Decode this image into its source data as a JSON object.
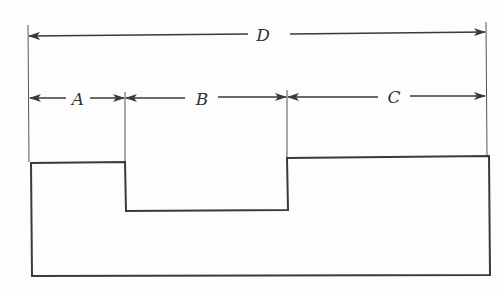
{
  "diagram": {
    "type": "dimensioned-profile",
    "colors": {
      "line": "#3a3a3a",
      "background": "#fdfdfd"
    },
    "dimensions": [
      {
        "id": "D",
        "label": "D",
        "from_x": 28,
        "to_x": 486,
        "y": 34,
        "label_x": 263
      },
      {
        "id": "A",
        "label": "A",
        "from_x": 29,
        "to_x": 125,
        "y": 98,
        "label_x": 77
      },
      {
        "id": "B",
        "label": "B",
        "from_x": 125,
        "to_x": 287,
        "y": 98,
        "label_x": 203
      },
      {
        "id": "C",
        "label": "C",
        "from_x": 287,
        "to_x": 486,
        "y": 97,
        "label_x": 392
      }
    ],
    "extension_lines": [
      {
        "x": 28,
        "y1": 25,
        "y2": 162
      },
      {
        "x": 125,
        "y1": 92,
        "y2": 162
      },
      {
        "x": 287,
        "y1": 90,
        "y2": 157
      },
      {
        "x": 486,
        "y1": 22,
        "y2": 157
      }
    ],
    "profile_points": "31,163 125,162 126,211 288,210 287,158 489,156 490,275 32,276"
  }
}
